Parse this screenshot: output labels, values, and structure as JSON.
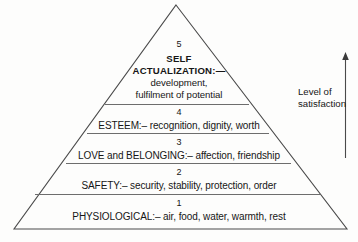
{
  "diagram": {
    "type": "pyramid",
    "levels": [
      {
        "number": "5",
        "name": "SELF ACTUALIZATION",
        "lines": [
          "SELF",
          "ACTUALIZATION:—",
          "development,",
          "fulfilment of potential"
        ]
      },
      {
        "number": "4",
        "name": "ESTEEM",
        "lines": [
          "ESTEEM:– recognition, dignity, worth"
        ]
      },
      {
        "number": "3",
        "name": "LOVE and BELONGING",
        "lines": [
          "LOVE and BELONGING:– affection, friendship"
        ]
      },
      {
        "number": "2",
        "name": "SAFETY",
        "lines": [
          "SAFETY:– security, stability, protection, order"
        ]
      },
      {
        "number": "1",
        "name": "PHYSIOLOGICAL",
        "lines": [
          "PHYSIOLOGICAL:– air, food, water, warmth, rest"
        ]
      }
    ]
  },
  "axis": {
    "label_line1": "Level of",
    "label_line2": "satisfaction",
    "direction": "up"
  },
  "colors": {
    "stroke": "#4a4a4a",
    "text": "#161616",
    "background": "#fdfdfc"
  }
}
